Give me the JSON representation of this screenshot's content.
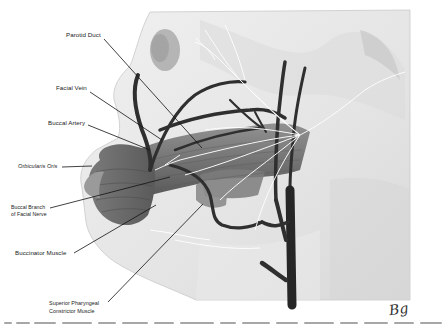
{
  "figure": {
    "labels": [
      {
        "id": "parotid-duct",
        "text": "Parotid Duct",
        "x": 66,
        "y": 34,
        "italic": false
      },
      {
        "id": "facial-vein",
        "text": "Facial Vein",
        "x": 56,
        "y": 85,
        "italic": false
      },
      {
        "id": "buccal-artery",
        "text": "Buccal Artery",
        "x": 48,
        "y": 120,
        "italic": false
      },
      {
        "id": "orbicularis-oris",
        "text": "Orbicularis Oris",
        "x": 18,
        "y": 163,
        "italic": true
      },
      {
        "id": "buccal-branch-1",
        "text": "Buccal Branch",
        "x": 11,
        "y": 204,
        "italic": false
      },
      {
        "id": "buccal-branch-2",
        "text": "of Facial Nerve",
        "x": 11,
        "y": 212,
        "italic": false
      },
      {
        "id": "buccinator-muscle",
        "text": "Buccinator Muscle",
        "x": 15,
        "y": 250,
        "italic": false
      },
      {
        "id": "superior-pharyngeal-1",
        "text": "Superior Pharyngeal",
        "x": 49,
        "y": 301,
        "italic": false
      },
      {
        "id": "superior-pharyngeal-2",
        "text": "Constrictor Muscle",
        "x": 49,
        "y": 309,
        "italic": false
      }
    ],
    "signature": "Bg",
    "colors": {
      "skin": "#e6e6e6",
      "skin_shadow": "#cfcfcf",
      "muscle": "#6e6e6e",
      "muscle_dark": "#4a4a4a",
      "vessel": "#2f2f2f",
      "nerve": "#ffffff",
      "leader": "#111111"
    }
  },
  "caption": {
    "note": "partially cut-off caption text line below figure"
  }
}
